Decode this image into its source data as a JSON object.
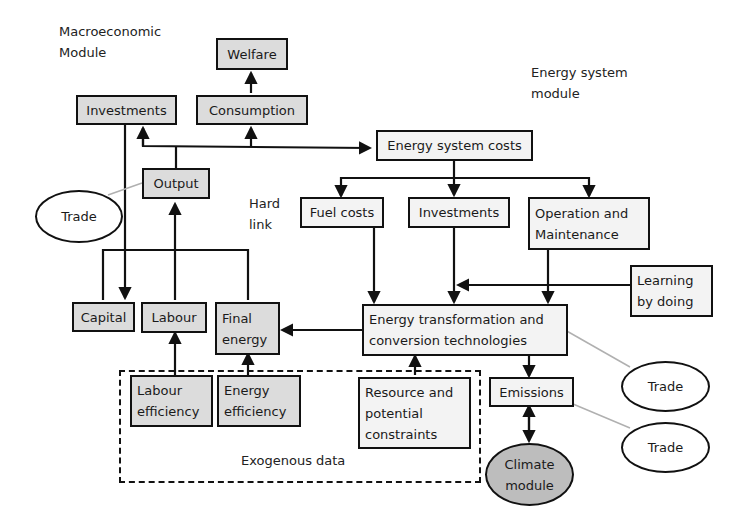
{
  "labels": {
    "macro_module_line1": "Macroeconomic",
    "macro_module_line2": "Module",
    "energy_module_line1": "Energy system",
    "energy_module_line2": "module",
    "hard_link_line1": "Hard",
    "hard_link_line2": "link",
    "exogenous": "Exogenous data"
  },
  "nodes": {
    "welfare": "Welfare",
    "investments_macro": "Investments",
    "consumption": "Consumption",
    "output": "Output",
    "energy_system_costs": "Energy system costs",
    "fuel_costs": "Fuel costs",
    "investments_energy": "Investments",
    "om_line1": "Operation and",
    "om_line2": "Maintenance",
    "learning_line1": "Learning",
    "learning_line2": "by doing",
    "capital": "Capital",
    "labour": "Labour",
    "final_energy_line1": "Final",
    "final_energy_line2": "energy",
    "etc_line1": "Energy transformation and",
    "etc_line2": "conversion technologies",
    "labour_eff_line1": "Labour",
    "labour_eff_line2": "efficiency",
    "energy_eff_line1": "Energy",
    "energy_eff_line2": "efficiency",
    "resource_line1": "Resource and",
    "resource_line2": "potential",
    "resource_line3": "constraints",
    "emissions": "Emissions",
    "climate_line1": "Climate",
    "climate_line2": "module"
  },
  "trade": {
    "left": "Trade",
    "right_top": "Trade",
    "right_bottom": "Trade"
  },
  "colors": {
    "macro_fill": "#dcdcdc",
    "energy_fill": "#f3f3f3",
    "climate_fill": "#bdbdbd",
    "line": "#111111",
    "trade_link": "#b0b0b0"
  }
}
